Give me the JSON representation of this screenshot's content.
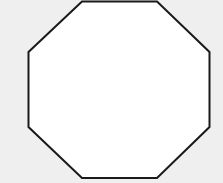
{
  "diagram": {
    "shape": "octagon",
    "fill": "#ffffff",
    "stroke": "#1a1a1a",
    "background": "#efefef",
    "stroke_width": 2,
    "points": "82,1.5 157,1.5 209.5,52 209.5,127 157,178 82,178 28.5,127 28.5,52"
  }
}
